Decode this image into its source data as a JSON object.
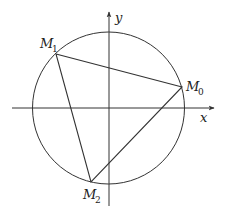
{
  "diagram": {
    "type": "geometry",
    "axes": {
      "x_label": "x",
      "y_label": "y"
    },
    "circle": {
      "center": "origin"
    },
    "points": [
      {
        "name": "M",
        "sub": "0",
        "label": "M0"
      },
      {
        "name": "M",
        "sub": "1",
        "label": "M1"
      },
      {
        "name": "M",
        "sub": "2",
        "label": "M2"
      }
    ],
    "triangle": [
      "M0",
      "M1",
      "M2"
    ],
    "colors": {
      "stroke": "#333333",
      "background": "#ffffff"
    }
  }
}
